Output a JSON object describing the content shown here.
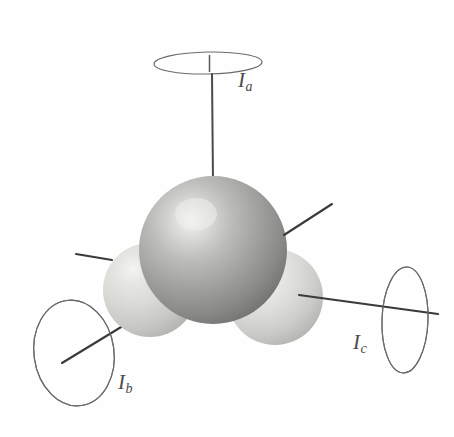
{
  "figure": {
    "type": "molecular-inertia-axes-diagram",
    "background_color": "#fefefe",
    "line_color": "#3a3a3a",
    "ellipse_stroke": "#555555",
    "label_color": "#4a4a4a"
  },
  "labels": {
    "axis_a": {
      "symbol": "I",
      "subscript": "a"
    },
    "axis_b": {
      "symbol": "I",
      "subscript": "b"
    },
    "axis_c": {
      "symbol": "I",
      "subscript": "c"
    }
  },
  "atoms": [
    {
      "name": "central-atom",
      "cx": 213,
      "cy": 250,
      "r": 74,
      "fill_light": "#f2f2f0",
      "fill_mid": "#a9a9a7",
      "fill_dark": "#6d6d6b",
      "highlight_x": 195,
      "highlight_y": 214
    },
    {
      "name": "left-atom",
      "cx": 150,
      "cy": 290,
      "r": 47,
      "fill_light": "#eeeeec",
      "fill_mid": "#d5d5d2",
      "fill_dark": "#b4b4b1",
      "highlight_x": 135,
      "highlight_y": 268
    },
    {
      "name": "right-atom",
      "cx": 275,
      "cy": 297,
      "r": 48,
      "fill_light": "#f4f4f2",
      "fill_mid": "#d8d8d5",
      "fill_dark": "#b9b9b6",
      "highlight_x": 259,
      "highlight_y": 274
    }
  ],
  "rotation_ellipses": [
    {
      "name": "ellipse-a",
      "cx": 208,
      "cy": 63,
      "rx": 54,
      "ry": 11,
      "rotation": -1
    },
    {
      "name": "ellipse-b",
      "cx": 74,
      "cy": 353,
      "rx": 40,
      "ry": 53,
      "rotation": -8
    },
    {
      "name": "ellipse-c",
      "cx": 405,
      "cy": 320,
      "rx": 23,
      "ry": 53,
      "rotation": 2
    }
  ],
  "axis_lines": [
    {
      "name": "axis-line-a",
      "x1": 212,
      "y1": 50,
      "x2": 212,
      "y2": 180
    },
    {
      "name": "axis-line-a-tick",
      "x1": 209,
      "y1": 55,
      "x2": 209,
      "y2": 72
    },
    {
      "name": "axis-line-b",
      "x1": 62,
      "y1": 363,
      "x2": 177,
      "y2": 293
    },
    {
      "name": "axis-line-c",
      "x1": 300,
      "y1": 296,
      "x2": 437,
      "y2": 313
    },
    {
      "name": "bond-line-upper-right",
      "x1": 286,
      "y1": 234,
      "x2": 331,
      "y2": 205
    },
    {
      "name": "bond-line-left",
      "x1": 76,
      "y1": 254,
      "x2": 110,
      "y2": 259
    }
  ]
}
